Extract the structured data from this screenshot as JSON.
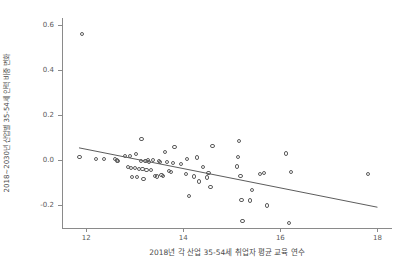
{
  "chart_data": {
    "type": "scatter",
    "title": "",
    "xlabel": "2018년 각 산업 35-54세 취업자 평균 교육 연수",
    "ylabel": "2018~2030년 산업별 35-54세 인력 비중 변화",
    "xlim": [
      11.5,
      18.3
    ],
    "ylim": [
      -0.3,
      0.63
    ],
    "xticks": [
      12,
      14,
      16,
      18
    ],
    "xticklabels": [
      "12",
      "14",
      "16",
      "18"
    ],
    "yticks": [
      0.6,
      0.4,
      0.2,
      0.0,
      -0.2
    ],
    "yticklabels": [
      "0.6",
      "0.4",
      "0.2",
      "0.0",
      "-0.2"
    ],
    "grid": false,
    "legend": null,
    "marker": "open-circle",
    "marker_color": "#5c5c5c",
    "trendline": {
      "type": "linear",
      "color": "#4a4a4a",
      "x_start": 11.85,
      "y_start": 0.055,
      "x_end": 18.0,
      "y_end": -0.208
    },
    "points": [
      {
        "x": 11.92,
        "y": 0.56
      },
      {
        "x": 11.86,
        "y": 0.015
      },
      {
        "x": 12.2,
        "y": 0.005
      },
      {
        "x": 12.36,
        "y": 0.004
      },
      {
        "x": 12.6,
        "y": 0.005
      },
      {
        "x": 12.63,
        "y": -0.001
      },
      {
        "x": 12.66,
        "y": -0.004
      },
      {
        "x": 12.8,
        "y": 0.018
      },
      {
        "x": 12.86,
        "y": -0.03
      },
      {
        "x": 12.9,
        "y": 0.02
      },
      {
        "x": 12.92,
        "y": -0.034
      },
      {
        "x": 12.95,
        "y": -0.075
      },
      {
        "x": 13.0,
        "y": -0.036
      },
      {
        "x": 13.02,
        "y": 0.026
      },
      {
        "x": 13.05,
        "y": -0.074
      },
      {
        "x": 13.08,
        "y": -0.038
      },
      {
        "x": 13.12,
        "y": -0.005
      },
      {
        "x": 13.14,
        "y": 0.095
      },
      {
        "x": 13.16,
        "y": -0.04
      },
      {
        "x": 13.18,
        "y": -0.082
      },
      {
        "x": 13.22,
        "y": -0.005
      },
      {
        "x": 13.24,
        "y": -0.042
      },
      {
        "x": 13.28,
        "y": 0.002
      },
      {
        "x": 13.3,
        "y": -0.006
      },
      {
        "x": 13.34,
        "y": -0.044
      },
      {
        "x": 13.38,
        "y": 0.0
      },
      {
        "x": 13.42,
        "y": -0.068
      },
      {
        "x": 13.45,
        "y": -0.072
      },
      {
        "x": 13.5,
        "y": -0.002
      },
      {
        "x": 13.52,
        "y": -0.006
      },
      {
        "x": 13.55,
        "y": -0.066
      },
      {
        "x": 13.58,
        "y": -0.07
      },
      {
        "x": 13.62,
        "y": 0.038
      },
      {
        "x": 13.66,
        "y": -0.008
      },
      {
        "x": 13.7,
        "y": -0.048
      },
      {
        "x": 13.74,
        "y": -0.052
      },
      {
        "x": 13.78,
        "y": -0.012
      },
      {
        "x": 13.82,
        "y": 0.06
      },
      {
        "x": 13.95,
        "y": -0.016
      },
      {
        "x": 14.05,
        "y": -0.06
      },
      {
        "x": 14.08,
        "y": 0.004
      },
      {
        "x": 14.12,
        "y": -0.16
      },
      {
        "x": 14.22,
        "y": -0.072
      },
      {
        "x": 14.28,
        "y": 0.012
      },
      {
        "x": 14.32,
        "y": -0.094
      },
      {
        "x": 14.4,
        "y": -0.03
      },
      {
        "x": 14.48,
        "y": -0.076
      },
      {
        "x": 14.52,
        "y": -0.056
      },
      {
        "x": 14.56,
        "y": -0.12
      },
      {
        "x": 14.6,
        "y": 0.062
      },
      {
        "x": 15.1,
        "y": -0.028
      },
      {
        "x": 15.12,
        "y": 0.016
      },
      {
        "x": 15.14,
        "y": 0.085
      },
      {
        "x": 15.18,
        "y": -0.07
      },
      {
        "x": 15.2,
        "y": -0.176
      },
      {
        "x": 15.22,
        "y": -0.268
      },
      {
        "x": 15.38,
        "y": -0.178
      },
      {
        "x": 15.42,
        "y": -0.132
      },
      {
        "x": 15.58,
        "y": -0.06
      },
      {
        "x": 15.66,
        "y": -0.058
      },
      {
        "x": 15.72,
        "y": -0.2
      },
      {
        "x": 16.12,
        "y": 0.03
      },
      {
        "x": 16.18,
        "y": -0.278
      },
      {
        "x": 16.22,
        "y": -0.052
      },
      {
        "x": 17.8,
        "y": -0.062
      }
    ]
  }
}
